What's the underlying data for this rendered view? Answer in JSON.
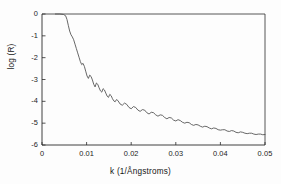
{
  "figure": {
    "background_color": "#fdfdfd",
    "line_color": "#4d4d4d",
    "axis_color": "#2b2b2b"
  },
  "chart_data": {
    "type": "line",
    "title": "",
    "subtitle": "",
    "xlabel": "k (1/Ångstroms)",
    "ylabel": "log (R)",
    "xlim": [
      0,
      0.05
    ],
    "ylim": [
      -6,
      0
    ],
    "xticks": [
      0,
      0.01,
      0.02,
      0.03,
      0.04,
      0.05
    ],
    "xtick_labels": [
      "0",
      "0.01",
      "0.02",
      "0.03",
      "0.04",
      "0.05"
    ],
    "yticks": [
      0,
      -1,
      -2,
      -3,
      -4,
      -5,
      -6
    ],
    "ytick_labels": [
      "0",
      "-1",
      "-2",
      "-3",
      "-4",
      "-5",
      "-6"
    ],
    "grid": false,
    "legend": "none",
    "frame": "box",
    "annotations": [],
    "series": [
      {
        "name": "log|R|",
        "description": "X-ray reflectivity: total external reflection plateau at log(R)=0 up to the critical angle near k=0.0055, then steep decay with damped Kiessig interference fringes of period about 0.0021 1/Angstroms",
        "x": [
          0.003,
          0.004,
          0.0048,
          0.0053,
          0.0056,
          0.0059,
          0.0062,
          0.0065,
          0.0068,
          0.0071,
          0.0074,
          0.0077,
          0.008,
          0.0083,
          0.0086,
          0.0089,
          0.0092,
          0.0095,
          0.0098,
          0.0101,
          0.0104,
          0.0107,
          0.011,
          0.0113,
          0.0116,
          0.0119,
          0.0122,
          0.0125,
          0.0128,
          0.0131,
          0.0134,
          0.0137,
          0.014,
          0.0143,
          0.0146,
          0.0149,
          0.0152,
          0.0155,
          0.0158,
          0.0161,
          0.0164,
          0.0167,
          0.017,
          0.0175,
          0.018,
          0.0185,
          0.019,
          0.0195,
          0.02,
          0.0205,
          0.021,
          0.0215,
          0.022,
          0.0225,
          0.023,
          0.0235,
          0.024,
          0.0245,
          0.025,
          0.0255,
          0.026,
          0.0265,
          0.027,
          0.0275,
          0.028,
          0.0285,
          0.029,
          0.0295,
          0.03,
          0.0305,
          0.031,
          0.0315,
          0.032,
          0.0325,
          0.033,
          0.0335,
          0.034,
          0.0345,
          0.035,
          0.0355,
          0.036,
          0.0365,
          0.037,
          0.0375,
          0.038,
          0.0385,
          0.039,
          0.0395,
          0.04,
          0.0405,
          0.041,
          0.0415,
          0.042,
          0.0425,
          0.043,
          0.0435,
          0.044,
          0.0445,
          0.045,
          0.0455,
          0.046,
          0.0465,
          0.047,
          0.0475,
          0.048,
          0.0485,
          0.049,
          0.0495,
          0.05
        ],
        "y": [
          0.0,
          0.0,
          -0.02,
          -0.08,
          -0.25,
          -0.52,
          -0.78,
          -0.95,
          -1.05,
          -1.18,
          -1.38,
          -1.58,
          -1.78,
          -1.98,
          -2.18,
          -2.32,
          -2.26,
          -2.4,
          -2.62,
          -2.84,
          -2.95,
          -2.8,
          -2.86,
          -3.02,
          -3.22,
          -3.34,
          -3.16,
          -3.22,
          -3.38,
          -3.52,
          -3.58,
          -3.42,
          -3.48,
          -3.62,
          -3.76,
          -3.82,
          -3.68,
          -3.74,
          -3.88,
          -3.98,
          -4.02,
          -3.92,
          -3.96,
          -4.12,
          -4.18,
          -4.08,
          -4.14,
          -4.28,
          -4.34,
          -4.24,
          -4.28,
          -4.4,
          -4.46,
          -4.38,
          -4.4,
          -4.52,
          -4.58,
          -4.5,
          -4.52,
          -4.62,
          -4.68,
          -4.62,
          -4.64,
          -4.74,
          -4.8,
          -4.74,
          -4.76,
          -4.86,
          -4.9,
          -4.84,
          -4.88,
          -4.96,
          -5.0,
          -4.96,
          -4.98,
          -5.06,
          -5.1,
          -5.06,
          -5.08,
          -5.14,
          -5.18,
          -5.14,
          -5.16,
          -5.22,
          -5.26,
          -5.22,
          -5.24,
          -5.3,
          -5.32,
          -5.3,
          -5.3,
          -5.36,
          -5.38,
          -5.34,
          -5.36,
          -5.42,
          -5.44,
          -5.4,
          -5.42,
          -5.46,
          -5.48,
          -5.46,
          -5.46,
          -5.5,
          -5.52,
          -5.5,
          -5.5,
          -5.53,
          -5.52
        ]
      }
    ]
  },
  "axes_geometry": {
    "left_px": 42,
    "right_px": 265,
    "top_px": 14,
    "bottom_px": 145
  }
}
